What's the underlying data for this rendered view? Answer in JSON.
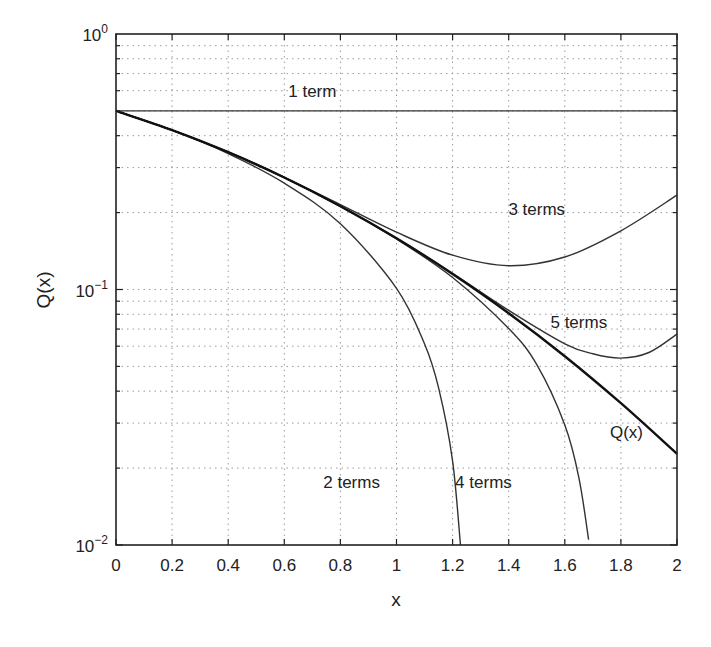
{
  "chart_data": {
    "type": "line",
    "title": "",
    "xlabel": "x",
    "ylabel": "Q(x)",
    "xscale": "linear",
    "yscale": "log",
    "xlim": [
      0,
      2
    ],
    "ylim": [
      0.01,
      1
    ],
    "grid": true,
    "legend": "none (inline curve labels)",
    "x_ticks": [
      0,
      0.2,
      0.4,
      0.6,
      0.8,
      1,
      1.2,
      1.4,
      1.6,
      1.8,
      2
    ],
    "x_tick_labels": [
      "0",
      "0.2",
      "0.4",
      "0.6",
      "0.8",
      "1",
      "1.2",
      "1.4",
      "1.6",
      "1.8",
      "2"
    ],
    "y_ticks": [
      1,
      0.1,
      0.01
    ],
    "y_tick_labels": [
      {
        "base": "10",
        "exp": "0"
      },
      {
        "base": "10",
        "exp": "−1"
      },
      {
        "base": "10",
        "exp": "−2"
      }
    ],
    "x": [
      0,
      0.2,
      0.4,
      0.6,
      0.8,
      1.0,
      1.2,
      1.4,
      1.6,
      1.8,
      2.0
    ],
    "series": [
      {
        "name": "1 term",
        "label": "1 term",
        "bold": false,
        "x": [
          0,
          0.2,
          0.4,
          0.6,
          0.8,
          1.0,
          1.2,
          1.4,
          1.6,
          1.8,
          2.0
        ],
        "values": [
          0.5,
          0.5,
          0.5,
          0.5,
          0.5,
          0.5,
          0.5,
          0.5,
          0.5,
          0.5,
          0.5
        ],
        "label_pos": [
          0.7,
          0.565
        ]
      },
      {
        "name": "2 terms",
        "label": "2 terms",
        "bold": false,
        "x": [
          0,
          0.2,
          0.4,
          0.6,
          0.8,
          1.0,
          1.1,
          1.15,
          1.2,
          1.228
        ],
        "values": [
          0.5,
          0.4202,
          0.3404,
          0.2606,
          0.1809,
          0.1011,
          0.0612,
          0.0412,
          0.0213,
          0.01
        ],
        "label_pos": [
          0.84,
          0.0167
        ]
      },
      {
        "name": "3 terms",
        "label": "3 terms",
        "bold": false,
        "x": [
          0,
          0.2,
          0.4,
          0.6,
          0.8,
          1.0,
          1.2,
          1.4,
          1.6,
          1.8,
          2.0
        ],
        "values": [
          0.5,
          0.4207,
          0.3447,
          0.275,
          0.2149,
          0.1676,
          0.1362,
          0.1239,
          0.134,
          0.1697,
          0.234
        ],
        "label_pos": [
          1.5,
          0.195
        ]
      },
      {
        "name": "4 terms",
        "label": "4 terms",
        "bold": false,
        "x": [
          0,
          0.2,
          0.4,
          0.6,
          0.8,
          1.0,
          1.2,
          1.4,
          1.5,
          1.6,
          1.65,
          1.685
        ],
        "values": [
          0.5,
          0.4207,
          0.3446,
          0.2742,
          0.2116,
          0.1576,
          0.1114,
          0.0703,
          0.0508,
          0.0295,
          0.0184,
          0.0105
        ],
        "label_pos": [
          1.31,
          0.0167
        ]
      },
      {
        "name": "5 terms",
        "label": "5 terms",
        "bold": false,
        "x": [
          0,
          0.2,
          0.4,
          0.6,
          0.8,
          1.0,
          1.2,
          1.4,
          1.6,
          1.7,
          1.8,
          1.9,
          2.0
        ],
        "values": [
          0.5,
          0.4207,
          0.3446,
          0.2743,
          0.2119,
          0.1588,
          0.1156,
          0.0828,
          0.0613,
          0.056,
          0.0539,
          0.0567,
          0.0669
        ],
        "label_pos": [
          1.65,
          0.071
        ]
      },
      {
        "name": "Q(x)",
        "label": "Q(x)",
        "bold": true,
        "x": [
          0,
          0.2,
          0.4,
          0.6,
          0.8,
          1.0,
          1.2,
          1.4,
          1.6,
          1.8,
          2.0
        ],
        "values": [
          0.5,
          0.4207,
          0.3446,
          0.2743,
          0.2119,
          0.1587,
          0.1151,
          0.0808,
          0.0548,
          0.0359,
          0.02275
        ],
        "label_pos": [
          1.82,
          0.0262
        ]
      }
    ]
  },
  "plot_area": {
    "left": 116,
    "top": 34,
    "right": 677,
    "bottom": 545
  }
}
